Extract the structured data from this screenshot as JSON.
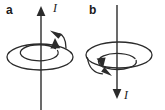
{
  "figure": {
    "background_color": "#ffffff",
    "stroke_color": "#2b2b2b",
    "panels": [
      {
        "id": "a",
        "label": "a",
        "current_label": "I",
        "current_direction": "up",
        "circulation": "counterclockwise-viewed-from-above",
        "axis": {
          "x": 41,
          "y_top": 8,
          "y_bottom": 110
        },
        "arrowhead": {
          "x": 41,
          "y": 8,
          "points": "up"
        },
        "ellipses": [
          {
            "cx": 40,
            "cy": 57,
            "rx": 33,
            "ry": 13,
            "name": "outer-field-loop"
          },
          {
            "cx": 40,
            "cy": 56,
            "rx": 19,
            "ry": 8,
            "name": "inner-field-loop"
          }
        ],
        "loop_arrowheads": [
          {
            "x": 58,
            "y": 33,
            "angle": -150,
            "name": "outer-loop-arrowhead"
          },
          {
            "x": 55,
            "y": 44,
            "angle": -105,
            "name": "inner-loop-arrowhead"
          }
        ]
      },
      {
        "id": "b",
        "label": "b",
        "current_label": "I",
        "current_direction": "down",
        "circulation": "clockwise-viewed-from-above",
        "axis": {
          "x": 34,
          "y_top": 5,
          "y_bottom": 97
        },
        "arrowhead": {
          "x": 34,
          "y": 97,
          "points": "down"
        },
        "ellipses": [
          {
            "cx": 36,
            "cy": 55,
            "rx": 33,
            "ry": 13,
            "name": "outer-field-loop"
          },
          {
            "cx": 36,
            "cy": 54,
            "rx": 19,
            "ry": 8,
            "name": "inner-field-loop"
          }
        ],
        "loop_arrowheads": [
          {
            "x": 17,
            "y": 63,
            "angle": 60,
            "name": "inner-loop-arrowhead"
          },
          {
            "x": 23,
            "y": 74,
            "angle": 25,
            "name": "outer-loop-arrowhead"
          }
        ]
      }
    ]
  }
}
